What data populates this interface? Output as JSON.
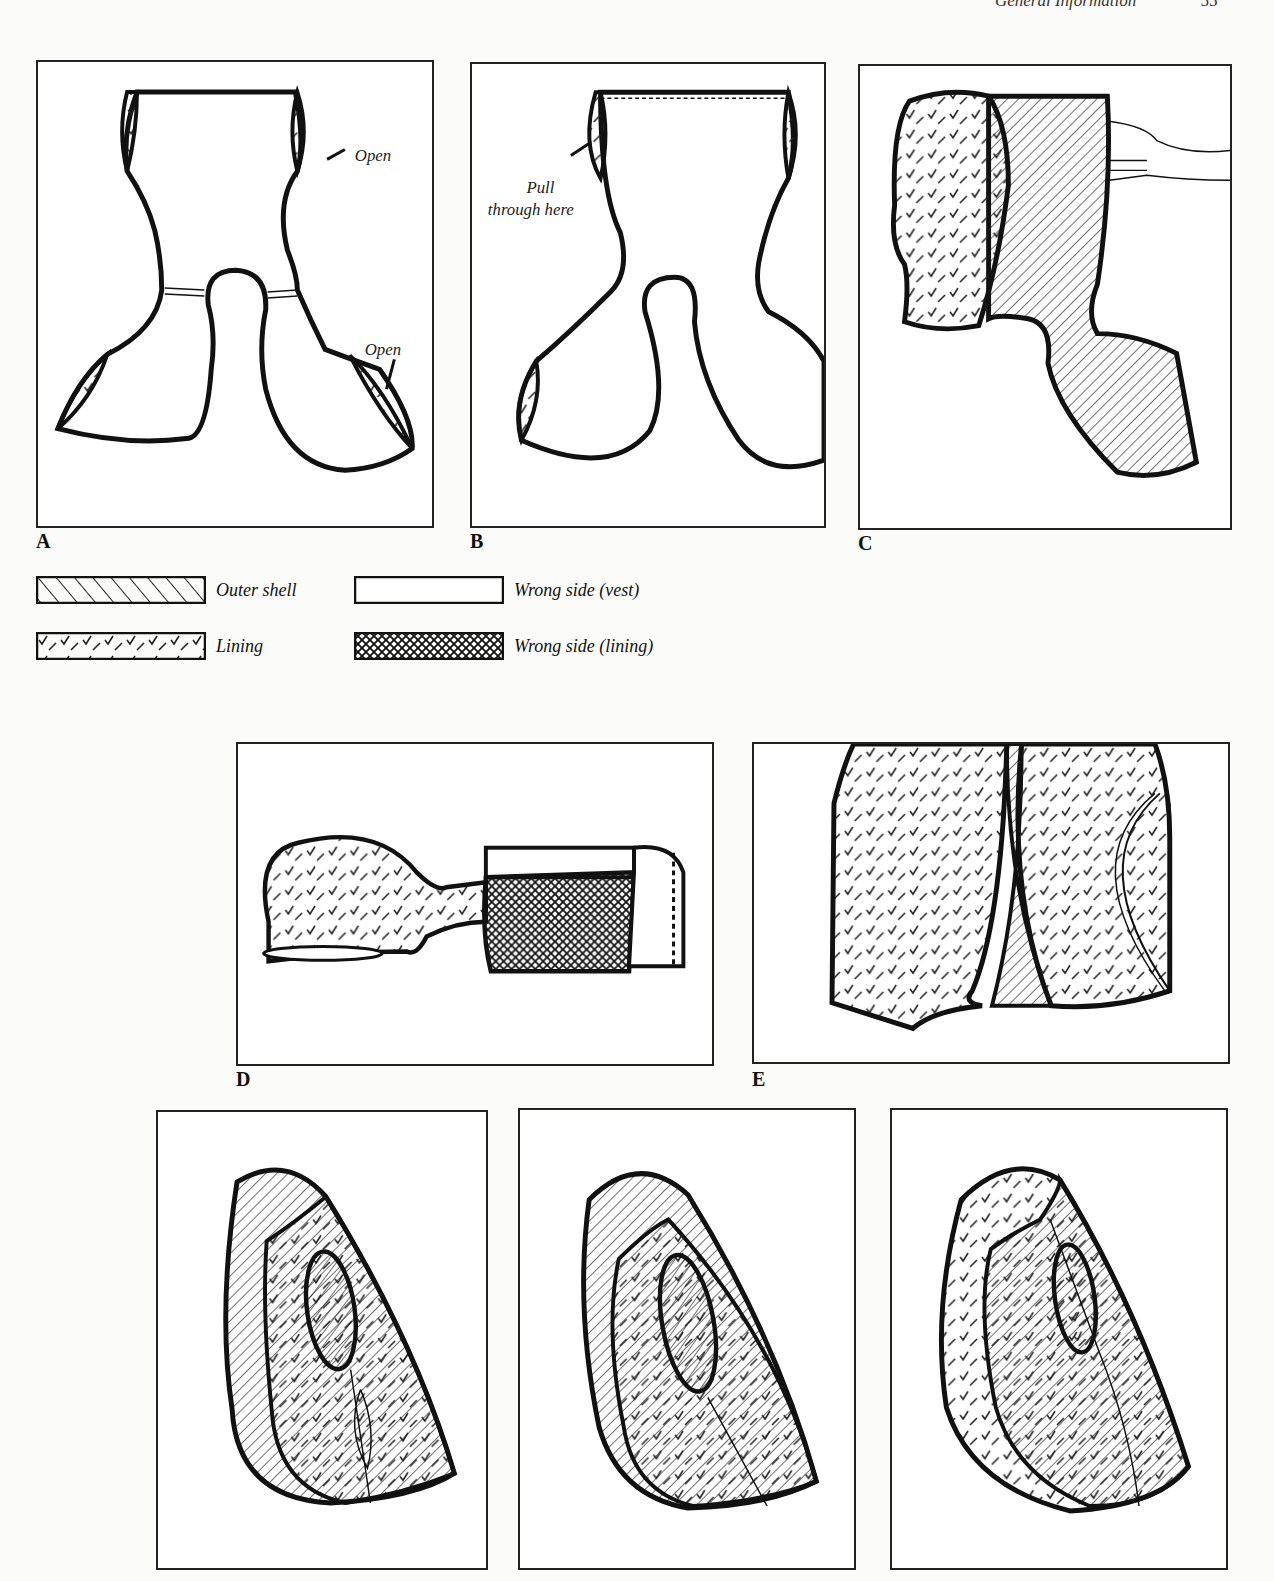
{
  "header": {
    "section": "General Information",
    "page": "55"
  },
  "panels": [
    {
      "id": "A",
      "label": "A",
      "annotations": [
        "Open",
        "Open"
      ]
    },
    {
      "id": "B",
      "label": "B",
      "annotations": [
        "Pull",
        "through here"
      ]
    },
    {
      "id": "C",
      "label": "C"
    },
    {
      "id": "D",
      "label": "D"
    },
    {
      "id": "E",
      "label": "E"
    },
    {
      "id": "F",
      "label": ""
    },
    {
      "id": "G",
      "label": ""
    },
    {
      "id": "H",
      "label": ""
    }
  ],
  "legend": [
    {
      "pattern": "outer-shell",
      "label": "Outer shell"
    },
    {
      "pattern": "wrong-side-vest",
      "label": "Wrong side (vest)"
    },
    {
      "pattern": "lining",
      "label": "Lining"
    },
    {
      "pattern": "wrong-side-lining",
      "label": "Wrong side (lining)"
    }
  ]
}
